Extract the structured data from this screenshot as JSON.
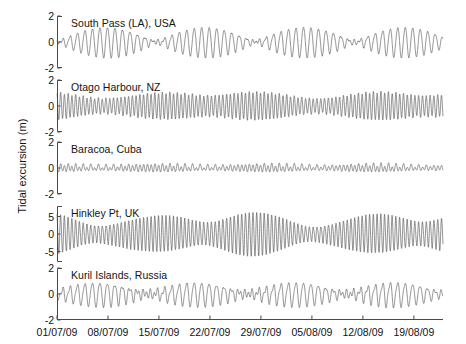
{
  "figure": {
    "ylabel": "Tidal excursion (m)",
    "line_color": "#4d4d4d",
    "axis_color": "#4a4a4a",
    "background": "#ffffff"
  },
  "chart_data": {
    "type": "line",
    "title": "",
    "xlabel": "",
    "ylabel": "Tidal excursion (m)",
    "grid": false,
    "legend": "none",
    "x_tick_labels": [
      "01/07/09",
      "08/07/09",
      "15/07/09",
      "22/07/09",
      "29/07/09",
      "05/08/09",
      "12/08/09",
      "19/08/09"
    ],
    "x_tick_days": [
      0,
      7,
      14,
      21,
      28,
      35,
      42,
      49
    ],
    "xlim_days": [
      0,
      53
    ],
    "panels": [
      {
        "name": "South Pass (LA), USA",
        "ylim": [
          -2,
          2
        ],
        "y_tick_labels": [
          "2",
          "0",
          "-2"
        ],
        "y_ticks": [
          2,
          0,
          -2
        ],
        "tide_type": "diurnal",
        "description": "Diurnal tide, strong spring-neap modulation with near-zero amplitude at neaps",
        "components": [
          {
            "name": "K1",
            "period_hours": 23.93,
            "amplitude_m": 0.62,
            "phase_deg": 20
          },
          {
            "name": "O1",
            "period_hours": 25.82,
            "amplitude_m": 0.55,
            "phase_deg": 200
          },
          {
            "name": "M2",
            "period_hours": 12.42,
            "amplitude_m": 0.1,
            "phase_deg": 60
          },
          {
            "name": "S2",
            "period_hours": 12.0,
            "amplitude_m": 0.04,
            "phase_deg": 120
          }
        ],
        "peak_amplitude_m": 1.2,
        "min_amplitude_m": 0.1
      },
      {
        "name": "Otago Harbour, NZ",
        "ylim": [
          -2,
          2
        ],
        "y_tick_labels": [
          "2",
          "0",
          "-2"
        ],
        "y_ticks": [
          2,
          0,
          -2
        ],
        "tide_type": "semidiurnal",
        "description": "Semidiurnal tide, fairly uniform amplitude near 1 m with modest spring-neap modulation",
        "components": [
          {
            "name": "M2",
            "period_hours": 12.42,
            "amplitude_m": 0.85,
            "phase_deg": 10
          },
          {
            "name": "S2",
            "period_hours": 12.0,
            "amplitude_m": 0.17,
            "phase_deg": 40
          },
          {
            "name": "N2",
            "period_hours": 12.66,
            "amplitude_m": 0.12,
            "phase_deg": 300
          },
          {
            "name": "K1",
            "period_hours": 23.93,
            "amplitude_m": 0.07,
            "phase_deg": 150
          }
        ],
        "peak_amplitude_m": 1.2,
        "min_amplitude_m": 0.68
      },
      {
        "name": "Baracoa, Cuba",
        "ylim": [
          -2,
          2
        ],
        "y_tick_labels": [
          "2",
          "0",
          "-2"
        ],
        "y_ticks": [
          2,
          0,
          -2
        ],
        "tide_type": "mixed semidiurnal",
        "description": "Small mixed tide, amplitude around 0.3 m with pronounced diurnal inequality",
        "components": [
          {
            "name": "M2",
            "period_hours": 12.42,
            "amplitude_m": 0.22,
            "phase_deg": 0
          },
          {
            "name": "S2",
            "period_hours": 12.0,
            "amplitude_m": 0.06,
            "phase_deg": 35
          },
          {
            "name": "K1",
            "period_hours": 23.93,
            "amplitude_m": 0.09,
            "phase_deg": 110
          },
          {
            "name": "O1",
            "period_hours": 25.82,
            "amplitude_m": 0.06,
            "phase_deg": 250
          }
        ],
        "peak_amplitude_m": 0.42,
        "min_amplitude_m": 0.16
      },
      {
        "name": "Hinkley Pt, UK",
        "ylim": [
          -8,
          8
        ],
        "y_tick_labels": [
          "5",
          "0",
          "-5"
        ],
        "y_ticks": [
          5,
          0,
          -5
        ],
        "tide_type": "macrotidal semidiurnal",
        "description": "Very large semidiurnal tide with strong spring-neap modulation, spring range beyond 5 m",
        "components": [
          {
            "name": "M2",
            "period_hours": 12.42,
            "amplitude_m": 4.1,
            "phase_deg": 5
          },
          {
            "name": "S2",
            "period_hours": 12.0,
            "amplitude_m": 1.5,
            "phase_deg": 50
          },
          {
            "name": "N2",
            "period_hours": 12.66,
            "amplitude_m": 0.8,
            "phase_deg": 320
          },
          {
            "name": "M4",
            "period_hours": 6.21,
            "amplitude_m": 0.35,
            "phase_deg": 100
          }
        ],
        "peak_amplitude_m": 6.2,
        "min_amplitude_m": 2.2
      },
      {
        "name": "Kuril Islands, Russia",
        "ylim": [
          -2,
          2
        ],
        "y_tick_labels": [
          "2",
          "0",
          "-2"
        ],
        "y_ticks": [
          2,
          0,
          -2
        ],
        "tide_type": "mixed mainly diurnal",
        "description": "Mixed mainly diurnal tide with strong fortnightly modulation, amplitude up to about 1 m",
        "components": [
          {
            "name": "K1",
            "period_hours": 23.93,
            "amplitude_m": 0.52,
            "phase_deg": 40
          },
          {
            "name": "O1",
            "period_hours": 25.82,
            "amplitude_m": 0.4,
            "phase_deg": 190
          },
          {
            "name": "M2",
            "period_hours": 12.42,
            "amplitude_m": 0.2,
            "phase_deg": 80
          },
          {
            "name": "S2",
            "period_hours": 12.0,
            "amplitude_m": 0.08,
            "phase_deg": 140
          }
        ],
        "peak_amplitude_m": 1.05,
        "min_amplitude_m": 0.22
      }
    ]
  },
  "layout": {
    "plot_left_px": 57,
    "plot_right_px": 443,
    "panel_tops_px": [
      16,
      80,
      142,
      206,
      268
    ],
    "panel_heights_px": [
      52,
      52,
      52,
      56,
      52
    ]
  }
}
